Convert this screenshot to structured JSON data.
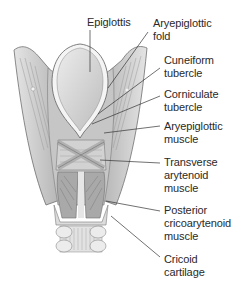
{
  "diagram": {
    "labels": [
      {
        "id": "epiglottis",
        "text": "Epiglottis"
      },
      {
        "id": "aryepiglottic-fold",
        "text": "Aryepiglottic\nfold"
      },
      {
        "id": "cuneiform-tubercle",
        "text": "Cuneiform\ntubercle"
      },
      {
        "id": "corniculate-tubercle",
        "text": "Corniculate\ntubercle"
      },
      {
        "id": "aryepiglottic-muscle",
        "text": "Aryepiglottic\nmuscle"
      },
      {
        "id": "transverse-arytenoid-muscle",
        "text": "Transverse\narytenoid\nmuscle"
      },
      {
        "id": "posterior-cricoarytenoid-muscle",
        "text": "Posterior\ncricoarytenoid\nmuscle"
      },
      {
        "id": "cricoid-cartilage",
        "text": "Cricoid\ncartilage"
      }
    ],
    "colors": {
      "outline": "#6e6e6e",
      "cartilage": "#d4d4d4",
      "cartilage_light": "#e8e8e8",
      "muscle": "#a9a9a9",
      "leader": "#333333",
      "text": "#2a2a2a"
    }
  }
}
